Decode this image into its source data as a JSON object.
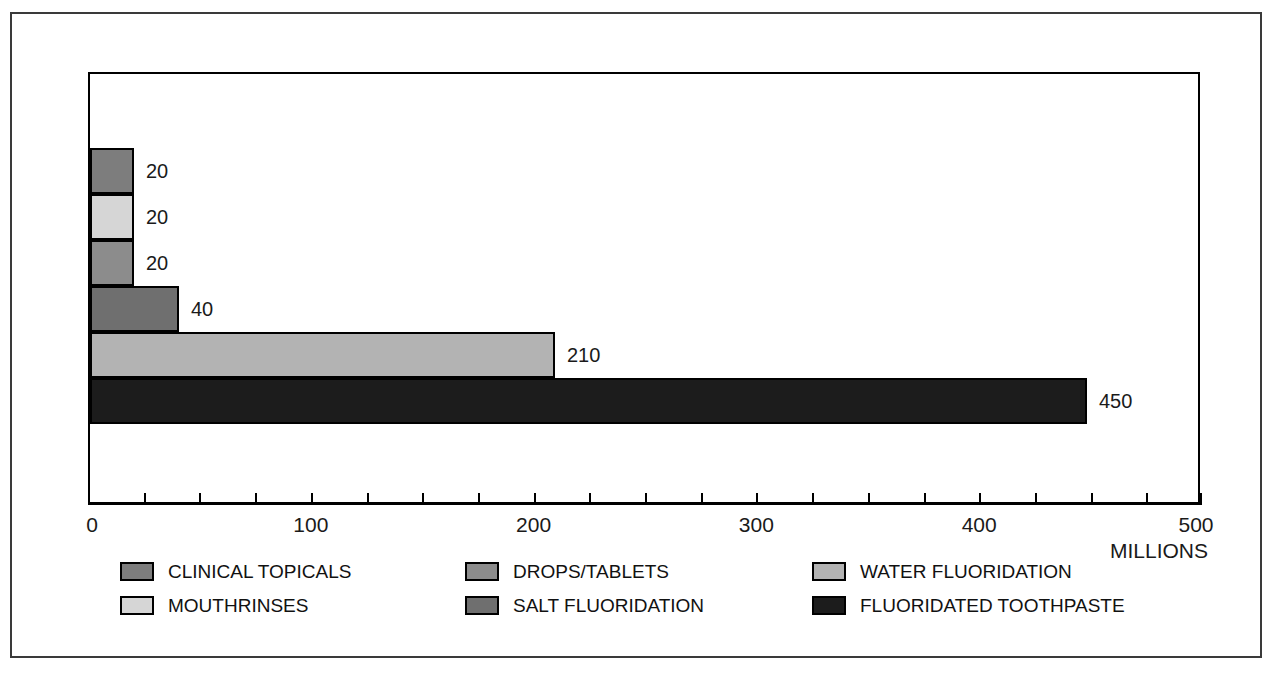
{
  "chart": {
    "type": "bar",
    "orientation": "horizontal",
    "title": "",
    "units_label": "MILLIONS"
  },
  "chart_data": {
    "type": "bar",
    "title": "",
    "xlabel": "MILLIONS",
    "ylabel": "",
    "xlim": [
      0,
      500
    ],
    "grid": false,
    "legend_position": "bottom",
    "categories": [
      "CLINICAL TOPICALS",
      "MOUTHRINSES",
      "DROPS/TABLETS",
      "SALT FLUORIDATION",
      "WATER FLUORIDATION",
      "FLUORIDATED TOOTHPASTE"
    ],
    "values": [
      20,
      20,
      20,
      40,
      210,
      450
    ],
    "value_labels": [
      "20",
      "20",
      "20",
      "40",
      "210",
      "450"
    ],
    "colors": [
      "#7d7d7d",
      "#d6d6d6",
      "#8c8c8c",
      "#6f6f6f",
      "#b3b3b3",
      "#1c1c1c"
    ],
    "xticks": [
      0,
      100,
      200,
      300,
      400,
      500
    ],
    "xtick_labels": [
      "0",
      "100",
      "200",
      "300",
      "400",
      "500"
    ],
    "xtick_minor_step": 25
  },
  "axis": {
    "ticks": [
      {
        "value": 0,
        "label": "0"
      },
      {
        "value": 100,
        "label": "100"
      },
      {
        "value": 200,
        "label": "200"
      },
      {
        "value": 300,
        "label": "300"
      },
      {
        "value": 400,
        "label": "400"
      },
      {
        "value": 500,
        "label": "500"
      }
    ],
    "units": "MILLIONS"
  },
  "legend": {
    "items": [
      {
        "label": "CLINICAL TOPICALS",
        "color": "#7d7d7d",
        "col": 0,
        "row": 0
      },
      {
        "label": "MOUTHRINSES",
        "color": "#d6d6d6",
        "col": 0,
        "row": 1
      },
      {
        "label": "DROPS/TABLETS",
        "color": "#8c8c8c",
        "col": 1,
        "row": 0
      },
      {
        "label": "SALT FLUORIDATION",
        "color": "#6f6f6f",
        "col": 1,
        "row": 1
      },
      {
        "label": "WATER FLUORIDATION",
        "color": "#b3b3b3",
        "col": 2,
        "row": 0
      },
      {
        "label": "FLUORIDATED TOOTHPASTE",
        "color": "#1c1c1c",
        "col": 2,
        "row": 1
      }
    ]
  }
}
